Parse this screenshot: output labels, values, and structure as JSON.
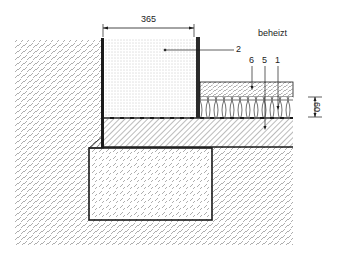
{
  "diagram": {
    "type": "construction-detail-section",
    "dimension_top": "365",
    "dimension_right": "60",
    "zone_label": "beheizt",
    "part_labels": {
      "wall": "2",
      "screed": "6",
      "membrane": "5",
      "insulation": "1"
    },
    "colors": {
      "line": "#1a1a1a",
      "hatch": "#555555",
      "background": "#ffffff"
    }
  }
}
